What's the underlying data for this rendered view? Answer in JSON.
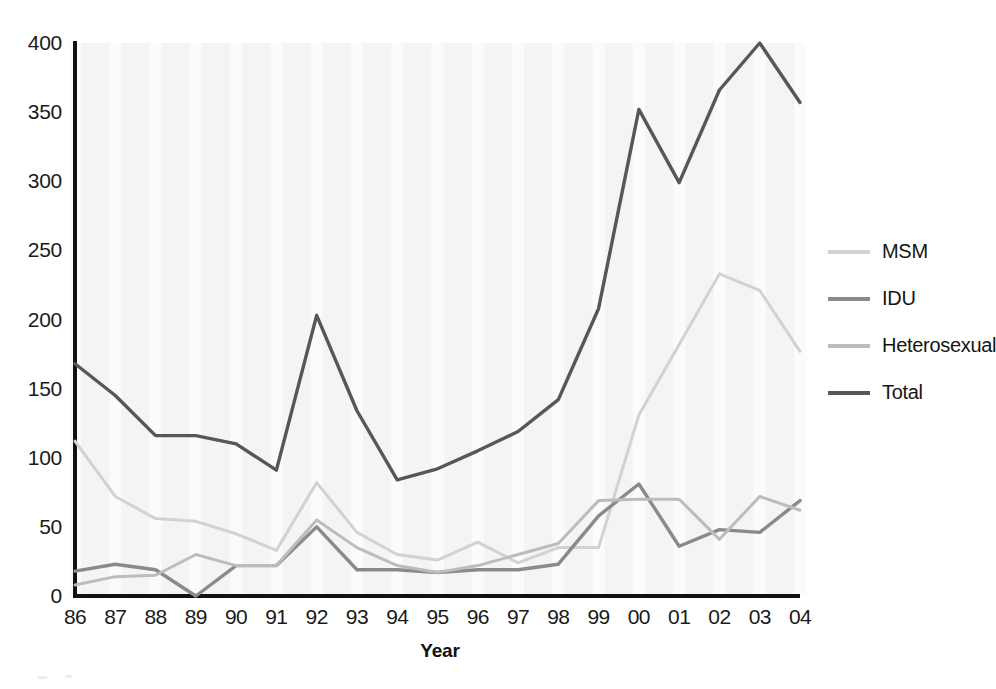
{
  "chart_data": {
    "type": "line",
    "title": "",
    "xlabel": "Year",
    "ylabel": "",
    "categories": [
      "86",
      "87",
      "88",
      "89",
      "90",
      "91",
      "92",
      "93",
      "94",
      "95",
      "96",
      "97",
      "98",
      "99",
      "00",
      "01",
      "02",
      "03",
      "04"
    ],
    "x_tick_labels": [
      "86",
      "87",
      "88",
      "89",
      "90",
      "91",
      "92",
      "93",
      "94",
      "95",
      "96",
      "97",
      "98",
      "99",
      "00",
      "01",
      "02",
      "03",
      "04"
    ],
    "y_tick_labels": [
      "0",
      "50",
      "100",
      "150",
      "200",
      "250",
      "300",
      "350",
      "400"
    ],
    "y_ticks": [
      0,
      50,
      100,
      150,
      200,
      250,
      300,
      350,
      400
    ],
    "ylim": [
      0,
      400
    ],
    "grid": "vertical-bands",
    "legend_position": "right",
    "series": [
      {
        "name": "MSM",
        "color": "#d2d2d2",
        "values": [
          112,
          72,
          56,
          54,
          45,
          33,
          82,
          46,
          30,
          26,
          39,
          24,
          35,
          35,
          131,
          182,
          233,
          221,
          177
        ]
      },
      {
        "name": "IDU",
        "color": "#8a8a8a",
        "values": [
          18,
          23,
          19,
          0,
          22,
          22,
          50,
          19,
          19,
          17,
          19,
          19,
          23,
          58,
          81,
          36,
          48,
          46,
          69
        ]
      },
      {
        "name": "Heterosexual",
        "color": "#bcbcbc",
        "values": [
          8,
          14,
          15,
          30,
          22,
          22,
          55,
          35,
          22,
          17,
          22,
          30,
          38,
          69,
          70,
          70,
          41,
          72,
          62
        ]
      },
      {
        "name": "Total",
        "color": "#575757",
        "values": [
          168,
          145,
          116,
          116,
          110,
          91,
          203,
          134,
          84,
          92,
          105,
          119,
          142,
          208,
          352,
          299,
          366,
          400,
          357
        ]
      }
    ]
  },
  "axis": {
    "x_title": "Year"
  },
  "legend": {
    "items": [
      {
        "label": "MSM",
        "color": "#d2d2d2"
      },
      {
        "label": "IDU",
        "color": "#8a8a8a"
      },
      {
        "label": "Heterosexual",
        "color": "#bcbcbc"
      },
      {
        "label": "Total",
        "color": "#575757"
      }
    ]
  }
}
